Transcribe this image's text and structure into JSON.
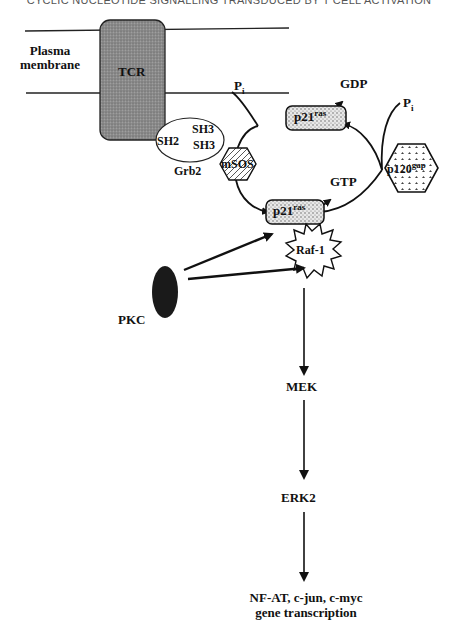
{
  "header": {
    "text": "CYCLIC NUCLEOTIDE SIGNALLING TRANSDUCED BY T CELL ACTIVATION"
  },
  "membrane": {
    "label_line1": "Plasma",
    "label_line2": "membrane"
  },
  "nodes": {
    "tcr": "TCR",
    "grb2": {
      "name": "Grb2",
      "sh2": "SH2",
      "sh3a": "SH3",
      "sh3b": "SH3"
    },
    "msos": "mSOS",
    "p21_gdp": {
      "base": "p21",
      "sup": "ras"
    },
    "p21_gtp": {
      "base": "p21",
      "sup": "ras"
    },
    "p120gap": {
      "base": "p120",
      "sup": "gap"
    },
    "gdp": "GDP",
    "gtp": "GTP",
    "pi_left": {
      "base": "P",
      "sub": "i"
    },
    "pi_right": {
      "base": "P",
      "sub": "i"
    },
    "raf1": "Raf-1",
    "pkc": "PKC",
    "mek": "MEK",
    "erk2": "ERK2",
    "output_line1": "NF-AT, c-jun, c-myc",
    "output_line2": "gene transcription"
  },
  "colors": {
    "tcr_fill": "#8a8a8a",
    "stipple": "#cfcfcf",
    "ink": "#111111"
  }
}
